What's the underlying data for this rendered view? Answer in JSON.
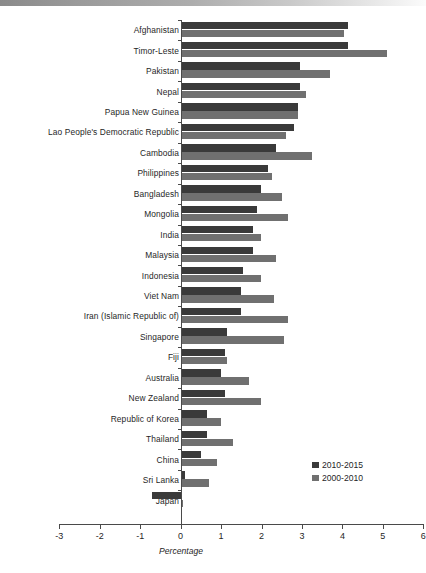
{
  "figure": {
    "xaxis_title": "Percentage",
    "scan_band_name": "scanned-page-edge"
  },
  "legend": {
    "items": [
      {
        "label": "2010-2015",
        "color": "#3a3a3a"
      },
      {
        "label": "2000-2010",
        "color": "#707070"
      }
    ]
  },
  "axis": {
    "ticks": [
      "-3",
      "-2",
      "-1",
      "0",
      "1",
      "2",
      "3",
      "4",
      "5",
      "6"
    ],
    "tick_values": [
      -3,
      -2,
      -1,
      0,
      1,
      2,
      3,
      4,
      5,
      6
    ]
  },
  "chart_data": {
    "type": "bar",
    "orientation": "horizontal",
    "title": "",
    "xlabel": "Percentage",
    "ylabel": "",
    "xlim": [
      -3,
      6
    ],
    "grid": false,
    "legend_position": "inside-right-lower",
    "categories": [
      "Afghanistan",
      "Timor-Leste",
      "Pakistan",
      "Nepal",
      "Papua New Guinea",
      "Lao People's Democratic Republic",
      "Cambodia",
      "Philippines",
      "Bangladesh",
      "Mongolia",
      "India",
      "Malaysia",
      "Indonesia",
      "Viet Nam",
      "Iran (Islamic Republic of)",
      "Singapore",
      "Fiji",
      "Australia",
      "New Zealand",
      "Republic of Korea",
      "Thailand",
      "China",
      "Sri Lanka",
      "Japan"
    ],
    "series": [
      {
        "name": "2010-2015",
        "color": "#3a3a3a",
        "values": [
          4.15,
          4.15,
          2.95,
          2.95,
          2.9,
          2.8,
          2.35,
          2.15,
          2.0,
          1.9,
          1.8,
          1.8,
          1.55,
          1.5,
          1.5,
          1.15,
          1.1,
          1.0,
          1.1,
          0.65,
          0.65,
          0.5,
          0.1,
          -0.7
        ]
      },
      {
        "name": "2000-2010",
        "color": "#707070",
        "values": [
          4.05,
          5.1,
          3.7,
          3.1,
          2.9,
          2.6,
          3.25,
          2.25,
          2.5,
          2.65,
          2.0,
          2.35,
          2.0,
          2.3,
          2.65,
          2.55,
          1.15,
          1.7,
          2.0,
          1.0,
          1.3,
          0.9,
          0.7,
          0.05
        ]
      }
    ]
  }
}
